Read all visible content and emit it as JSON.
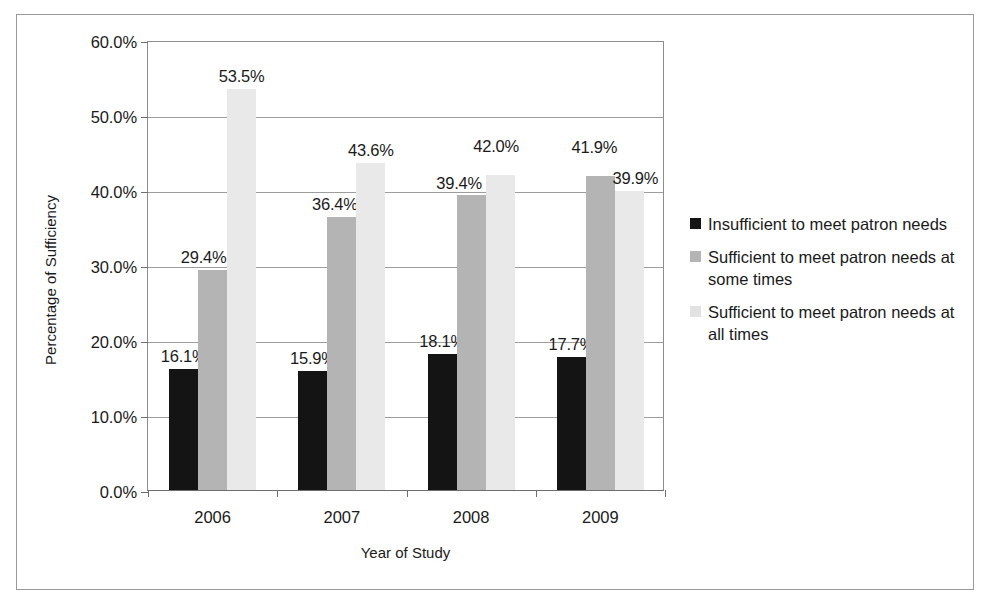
{
  "chart_data": {
    "type": "bar",
    "title": "",
    "subtitle": "",
    "xlabel": "Year of Study",
    "ylabel": "Percentage of Sufficiency",
    "categories": [
      "2006",
      "2007",
      "2008",
      "2009"
    ],
    "series": [
      {
        "name": "Insufficient to meet patron needs",
        "color": "#141414",
        "values": [
          16.1,
          15.9,
          18.1,
          17.7
        ],
        "labels": [
          "16.1%",
          "15.9%",
          "18.1%",
          "17.7%"
        ]
      },
      {
        "name": "Sufficient to meet patron needs at some times",
        "color": "#b4b4b4",
        "values": [
          29.4,
          36.4,
          39.4,
          41.9
        ],
        "labels": [
          "29.4%",
          "36.4%",
          "39.4%",
          "41.9%"
        ]
      },
      {
        "name": "Sufficient to meet patron needs at all times",
        "color": "#e9e9e9",
        "values": [
          53.5,
          43.6,
          42.0,
          39.9
        ],
        "labels": [
          "53.5%",
          "43.6%",
          "42.0%",
          "39.9%"
        ]
      }
    ],
    "ylim": [
      0,
      60
    ],
    "ytick_values": [
      0,
      10,
      20,
      30,
      40,
      50,
      60
    ],
    "ytick_labels": [
      "0.0%",
      "10.0%",
      "20.0%",
      "30.0%",
      "40.0%",
      "50.0%",
      "60.0%"
    ],
    "grid": true,
    "legend_position": "right",
    "value_labels_shown": true
  },
  "axes": {
    "y_title": "Percentage of Sufficiency",
    "x_title": "Year of Study"
  },
  "legend": {
    "items": [
      {
        "label": "Insufficient to meet patron needs",
        "swatch": "legend-swatch-black"
      },
      {
        "label": "Sufficient to meet patron needs at some times",
        "swatch": "legend-swatch-gray"
      },
      {
        "label": "Sufficient to meet patron needs at all times",
        "swatch": "legend-swatch-light"
      }
    ]
  }
}
